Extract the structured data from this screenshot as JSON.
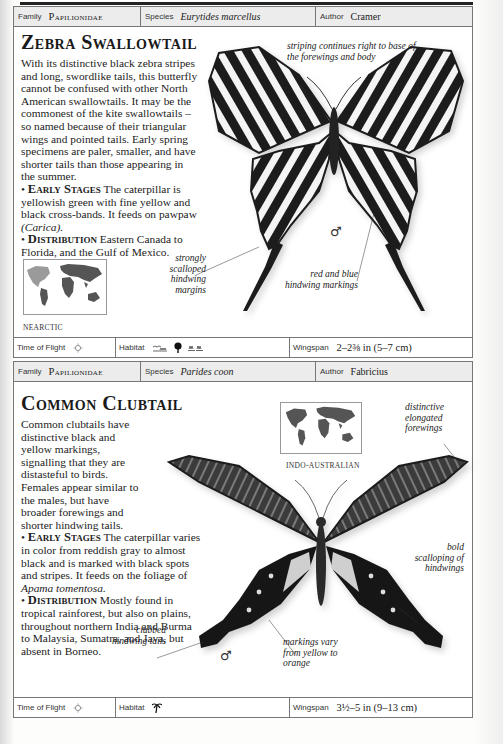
{
  "page": {
    "background": "#fdfdfb",
    "frame_color": "#777777",
    "header_fill": "#ececec"
  },
  "entries": [
    {
      "header": {
        "family_label": "Family",
        "family": "Papilionidae",
        "species_label": "Species",
        "species": "Eurytides marcellus",
        "author_label": "Author",
        "author": "Cramer"
      },
      "title": "Zebra Swallowtail",
      "description": "With its distinctive black zebra stripes and long, swordlike tails, this butterfly cannot be confused with other North American swallowtails. It may be the commonest of the kite swallowtails – so named because of their triangular wings and pointed tails. Early spring specimens are paler, smaller, and have shorter tails than those appearing in the summer.",
      "early_stages_label": "Early Stages",
      "early_stages_text": "The caterpillar is yellowish green with fine yellow and black cross-bands. It feeds on pawpaw",
      "early_stages_italic": "(Carica).",
      "distribution_label": "Distribution",
      "distribution_text": "Eastern Canada to Florida, and the Gulf of Mexico.",
      "region": "NEARCTIC",
      "sex_symbol": "♂",
      "annotations": [
        "striping continues right to base of the forewings and body",
        "strongly scalloped hindwing margins",
        "red and blue hindwing markings"
      ],
      "footer": {
        "time_of_flight_label": "Time of Flight",
        "time_of_flight_icon": "sun-icon",
        "habitat_label": "Habitat",
        "habitat_icons": [
          "wetland-icon",
          "tree-icon",
          "grassland-icon"
        ],
        "wingspan_label": "Wingspan",
        "wingspan": "2–2⅜ in (5–7 cm)"
      }
    },
    {
      "header": {
        "family_label": "Family",
        "family": "Papilionidae",
        "species_label": "Species",
        "species": "Parides coon",
        "author_label": "Author",
        "author": "Fabricius"
      },
      "title": "Common Clubtail",
      "description": "Common clubtails have distinctive black and yellow markings, signalling that they are distasteful to birds. Females appear similar to the males, but have broader forewings and shorter hindwing tails.",
      "early_stages_label": "Early Stages",
      "early_stages_text": "The caterpillar varies in color from reddish gray to almost black and is marked with black spots and stripes. It feeds on the foliage of",
      "early_stages_italic": "Apama tomentosa.",
      "distribution_label": "Distribution",
      "distribution_text": "Mostly found in tropical rainforest, but also on plains, throughout northern India and Burma to Malaysia, Sumatra, and Java, but absent in Borneo.",
      "region": "INDO-AUSTRALIAN",
      "sex_symbol": "♂",
      "annotations": [
        "distinctive elongated forewings",
        "bold scalloping of hindwings",
        "clubbed hindwing tails",
        "markings vary from yellow to orange"
      ],
      "footer": {
        "time_of_flight_label": "Time of Flight",
        "time_of_flight_icon": "sun-icon",
        "habitat_label": "Habitat",
        "habitat_icons": [
          "palm-tree-icon"
        ],
        "wingspan_label": "Wingspan",
        "wingspan": "3½–5 in (9–13 cm)"
      }
    }
  ]
}
